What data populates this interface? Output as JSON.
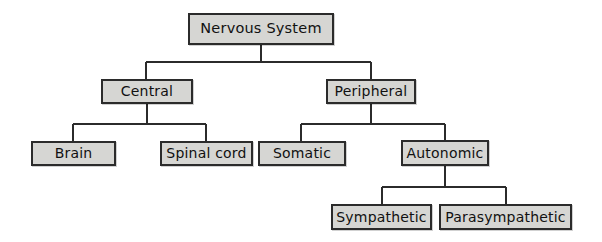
{
  "diagram": {
    "title": "Nervous System",
    "type": "hierarchy-tree",
    "background_color": "#ffffff",
    "node_fill_color": "#d6d6d3",
    "node_border_color": "#2b2b2b",
    "text_color": "#111111",
    "connector_color": "#2b2b2b",
    "nodes": [
      {
        "id": "nervous-system",
        "label": "Nervous System",
        "level": 0,
        "x": 188,
        "y": 13,
        "w": 146,
        "h": 32,
        "font_size": 14.5
      },
      {
        "id": "central",
        "label": "Central",
        "level": 1,
        "x": 101,
        "y": 79,
        "w": 92,
        "h": 25,
        "font_size": 14
      },
      {
        "id": "peripheral",
        "label": "Peripheral",
        "level": 1,
        "x": 326,
        "y": 79,
        "w": 90,
        "h": 25,
        "font_size": 14
      },
      {
        "id": "brain",
        "label": "Brain",
        "level": 2,
        "x": 31,
        "y": 141,
        "w": 85,
        "h": 25,
        "font_size": 14
      },
      {
        "id": "spinal-cord",
        "label": "Spinal cord",
        "level": 2,
        "x": 160,
        "y": 141,
        "w": 93,
        "h": 25,
        "font_size": 14
      },
      {
        "id": "somatic",
        "label": "Somatic",
        "level": 2,
        "x": 258,
        "y": 141,
        "w": 88,
        "h": 25,
        "font_size": 14
      },
      {
        "id": "autonomic",
        "label": "Autonomic",
        "level": 2,
        "x": 401,
        "y": 140,
        "w": 88,
        "h": 26,
        "font_size": 14
      },
      {
        "id": "sympathetic",
        "label": "Sympathetic",
        "level": 3,
        "x": 331,
        "y": 204,
        "w": 101,
        "h": 26,
        "font_size": 14
      },
      {
        "id": "parasympathetic",
        "label": "Parasympathetic",
        "level": 3,
        "x": 439,
        "y": 204,
        "w": 133,
        "h": 26,
        "font_size": 14
      }
    ],
    "connectors": [
      {
        "id": "root-to-level1",
        "from": "nervous-system",
        "to": [
          "central",
          "peripheral"
        ],
        "stem_x": 261,
        "stem_y1": 45,
        "stem_y2": 62,
        "bar_y": 62,
        "bar_x1": 146,
        "bar_x2": 371,
        "drops": [
          {
            "x": 146,
            "y2": 79
          },
          {
            "x": 371,
            "y2": 79
          }
        ]
      },
      {
        "id": "central-to-children",
        "from": "central",
        "to": [
          "brain",
          "spinal-cord"
        ],
        "stem_x": 147,
        "stem_y1": 104,
        "stem_y2": 124,
        "bar_y": 124,
        "bar_x1": 73,
        "bar_x2": 206,
        "drops": [
          {
            "x": 73,
            "y2": 141
          },
          {
            "x": 206,
            "y2": 141
          }
        ]
      },
      {
        "id": "peripheral-to-children",
        "from": "peripheral",
        "to": [
          "somatic",
          "autonomic"
        ],
        "stem_x": 371,
        "stem_y1": 104,
        "stem_y2": 124,
        "bar_y": 124,
        "bar_x1": 301,
        "bar_x2": 445,
        "drops": [
          {
            "x": 301,
            "y2": 141
          },
          {
            "x": 445,
            "y2": 140
          }
        ]
      },
      {
        "id": "autonomic-to-children",
        "from": "autonomic",
        "to": [
          "sympathetic",
          "parasympathetic"
        ],
        "stem_x": 445,
        "stem_y1": 166,
        "stem_y2": 187,
        "bar_y": 187,
        "bar_x1": 382,
        "bar_x2": 506,
        "drops": [
          {
            "x": 382,
            "y2": 204
          },
          {
            "x": 506,
            "y2": 204
          }
        ]
      }
    ]
  }
}
